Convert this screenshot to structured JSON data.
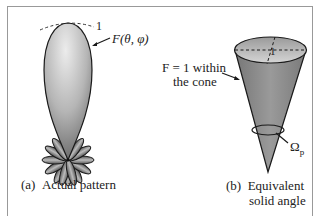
{
  "panel_a": {
    "caption_tag": "(a)",
    "caption_text": "Actual pattern",
    "max_level_label": "1",
    "pattern_label": "F(θ, φ)"
  },
  "panel_b": {
    "caption_tag": "(b)",
    "caption_line1": "Equivalent",
    "caption_line2": "solid angle",
    "cone_label_line1": "F = 1 within",
    "cone_label_line2": "the cone",
    "top_level_label": "1",
    "solid_angle_label": "Ω",
    "solid_angle_subscript": "p"
  },
  "colors": {
    "frame": "#999999",
    "outline": "#1a1a1a",
    "fill_light": "#e6e6e6",
    "fill_dark": "#6e6e6e",
    "cone_fill": "#8a8a8a"
  }
}
